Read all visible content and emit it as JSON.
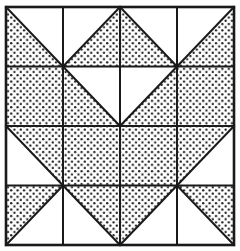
{
  "figure": {
    "kind": "quilt-block-diagram",
    "grid_rows": 4,
    "grid_cols": 4,
    "fill_style": "stipple-dots",
    "colors": {
      "background": "#ffffff",
      "line": "#1a1a1a",
      "dot": "#1a1a1a",
      "shaded_base": "#ffffff"
    },
    "geometry": {
      "outer_left": 6,
      "outer_top": 7,
      "outer_right": 234,
      "outer_bottom": 245,
      "outer_border_width": 2.6,
      "grid_line_width": 2.0,
      "diagonal_line_width": 2.0,
      "dot_radius": 1.15,
      "dot_spacing": 6.4
    },
    "cells": [
      [
        {
          "row": 0,
          "col": 0,
          "shape": "triangle",
          "shaded": "lower-left"
        },
        {
          "row": 0,
          "col": 1,
          "shape": "triangle",
          "shaded": "lower-right"
        },
        {
          "row": 0,
          "col": 2,
          "shape": "triangle",
          "shaded": "lower-left"
        },
        {
          "row": 0,
          "col": 3,
          "shape": "triangle",
          "shaded": "lower-right"
        }
      ],
      [
        {
          "row": 1,
          "col": 0,
          "shape": "square",
          "shaded": "full"
        },
        {
          "row": 1,
          "col": 1,
          "shape": "triangle",
          "shaded": "lower-left"
        },
        {
          "row": 1,
          "col": 2,
          "shape": "triangle",
          "shaded": "lower-right"
        },
        {
          "row": 1,
          "col": 3,
          "shape": "square",
          "shaded": "full"
        }
      ],
      [
        {
          "row": 2,
          "col": 0,
          "shape": "triangle",
          "shaded": "upper-right"
        },
        {
          "row": 2,
          "col": 1,
          "shape": "square",
          "shaded": "full"
        },
        {
          "row": 2,
          "col": 2,
          "shape": "square",
          "shaded": "full"
        },
        {
          "row": 2,
          "col": 3,
          "shape": "triangle",
          "shaded": "upper-left"
        }
      ],
      [
        {
          "row": 3,
          "col": 0,
          "shape": "triangle",
          "shaded": "upper-left"
        },
        {
          "row": 3,
          "col": 1,
          "shape": "triangle",
          "shaded": "upper-right"
        },
        {
          "row": 3,
          "col": 2,
          "shape": "triangle",
          "shaded": "upper-left"
        },
        {
          "row": 3,
          "col": 3,
          "shape": "triangle",
          "shaded": "upper-right"
        }
      ]
    ]
  }
}
